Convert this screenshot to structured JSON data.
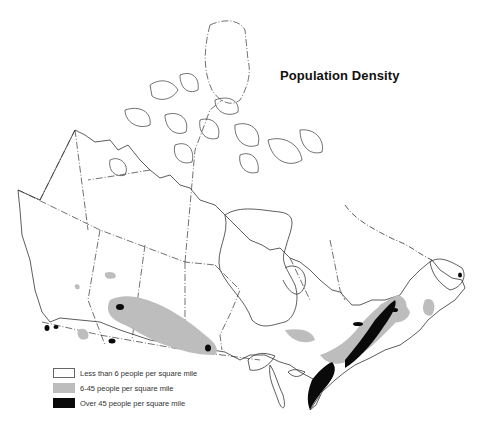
{
  "map": {
    "title": "Population Density",
    "region": "Canada",
    "colors": {
      "low": "#ffffff",
      "medium": "#bdbdbd",
      "high": "#0a0a0a",
      "outline": "#333333"
    }
  },
  "legend": {
    "items": [
      {
        "label": "Less than 6 people per square mile",
        "color": "#ffffff"
      },
      {
        "label": "6-45 people per square mile",
        "color": "#bdbdbd"
      },
      {
        "label": "Over 45 people per square mile",
        "color": "#0a0a0a"
      }
    ]
  }
}
